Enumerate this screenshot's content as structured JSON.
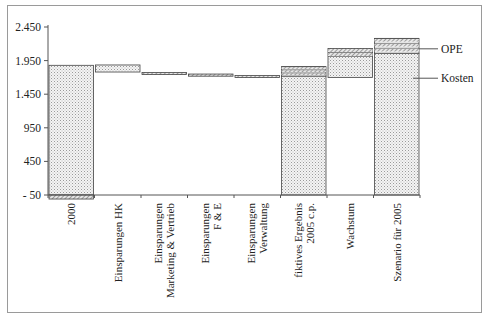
{
  "chart_data": {
    "type": "bar",
    "subtype": "waterfall",
    "title": "",
    "xlabel": "",
    "ylabel": "",
    "ylim": [
      -50,
      2450
    ],
    "yticks": [
      "2.450",
      "1.950",
      "1.450",
      "950",
      "450",
      "- 50"
    ],
    "ytick_values": [
      2450,
      1950,
      1450,
      950,
      450,
      -50
    ],
    "grid": false,
    "categories": [
      "2000",
      "Einsparungen HK",
      "Einsparungen Marketing & Vertrieb",
      "Einsparungen F & E",
      "Einsparungen Verwaltung",
      "fiktives Ergebnis 2005 c.p.",
      "Wachstum",
      "Szenario für 2005"
    ],
    "category_label_lines": [
      [
        "2000"
      ],
      [
        "Einsparungen HK"
      ],
      [
        "Einsparungen",
        "Marketing & Vertrieb"
      ],
      [
        "Einsparungen",
        "F & E"
      ],
      [
        "Einsparungen",
        "Verwaltung"
      ],
      [
        "fiktives Ergebnis",
        "2005 c.p."
      ],
      [
        "Wachstum"
      ],
      [
        "Szenario für 2005"
      ]
    ],
    "bars": [
      {
        "category": "2000",
        "base": -50,
        "top": 1880,
        "opeBelow": -110
      },
      {
        "category": "Einsparungen HK",
        "base": 1780,
        "top": 1885
      },
      {
        "category": "Einsparungen Marketing & Vertrieb",
        "base": 1745,
        "top": 1772
      },
      {
        "category": "Einsparungen F & E",
        "base": 1718,
        "top": 1750
      },
      {
        "category": "Einsparungen Verwaltung",
        "base": 1700,
        "top": 1727
      },
      {
        "category": "fiktives Ergebnis 2005 c.p.",
        "base": -50,
        "kosten": 1720,
        "top": 1860
      },
      {
        "category": "Wachstum",
        "base": 1700,
        "top": 2130
      },
      {
        "category": "Szenario für 2005",
        "base": -50,
        "kosten": 2060,
        "top": 2280
      }
    ],
    "series": [
      {
        "name": "Kosten",
        "pattern": "dotted"
      },
      {
        "name": "OPE",
        "pattern": "hatched"
      }
    ],
    "legend": [
      "OPE",
      "Kosten"
    ],
    "legend_position": "right"
  },
  "colors": {
    "frame": "#9a9a9a",
    "axis": "#555555",
    "bar_outline": "#444444",
    "dot_fill": "#bfbfbf",
    "hatch": "#555555"
  }
}
